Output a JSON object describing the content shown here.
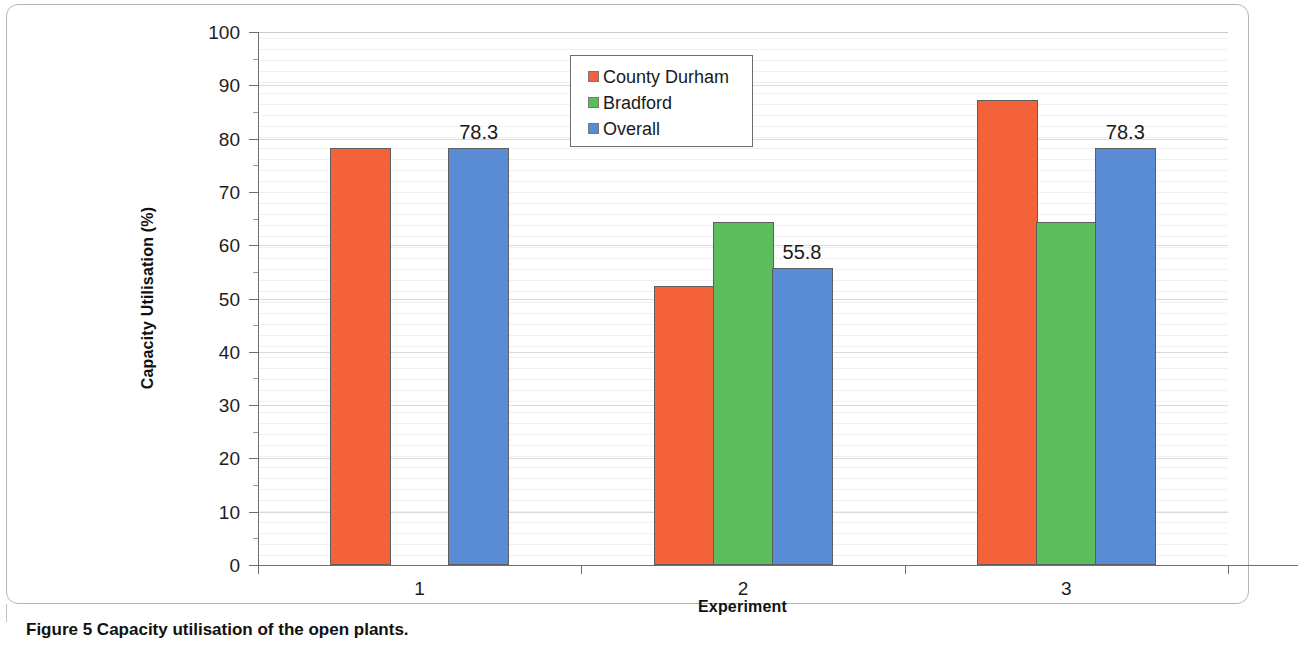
{
  "figure": {
    "caption_label": "Figure 5",
    "caption_text": "Capacity utilisation of the open plants."
  },
  "legend": {
    "position": "inside-top-center",
    "items": [
      {
        "label": "County Durham",
        "color": "#f4623a"
      },
      {
        "label": "Bradford",
        "color": "#5cbd5c"
      },
      {
        "label": "Overall",
        "color": "#5a8cd6"
      }
    ]
  },
  "chart_data": {
    "type": "bar",
    "title": "",
    "subtitle": "",
    "xlabel": "Experiment",
    "ylabel": "Capacity Utilisation (%)",
    "categories": [
      "1",
      "2",
      "3"
    ],
    "ylim": [
      0,
      100
    ],
    "ytick_values": [
      0,
      10,
      20,
      30,
      40,
      50,
      60,
      70,
      80,
      90,
      100
    ],
    "ytick_labels": [
      "0",
      "10",
      "20",
      "30",
      "40",
      "50",
      "60",
      "70",
      "80",
      "90",
      "100"
    ],
    "grid": true,
    "grid_axis": "y",
    "legend_position": "inside-top-center",
    "series": [
      {
        "name": "County Durham",
        "color": "#f4623a",
        "values": [
          78.3,
          52.4,
          87.3
        ]
      },
      {
        "name": "Bradford",
        "color": "#5cbd5c",
        "values": [
          null,
          64.4,
          64.4
        ]
      },
      {
        "name": "Overall",
        "color": "#5a8cd6",
        "values": [
          78.3,
          55.8,
          78.3
        ]
      }
    ],
    "data_labels": [
      {
        "series": "Overall",
        "category": "1",
        "value": 78.3,
        "text": "78.3"
      },
      {
        "series": "Overall",
        "category": "2",
        "value": 55.8,
        "text": "55.8"
      },
      {
        "series": "Overall",
        "category": "3",
        "value": 78.3,
        "text": "78.3"
      }
    ]
  }
}
